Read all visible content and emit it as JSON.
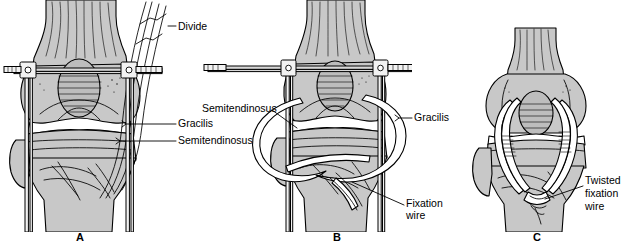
{
  "figure": {
    "background_color": "#ffffff",
    "bone_fill_color": "#c8c8c8",
    "bone_shade_color": "#a9a9a9",
    "line_color": "#000000",
    "graft_color": "#ffffff"
  },
  "panels": [
    {
      "id": "A",
      "letter": "A",
      "labels": [
        {
          "key": "divide",
          "text": "Divide"
        },
        {
          "key": "gracilis",
          "text": "Gracilis"
        },
        {
          "key": "semitendinosus",
          "text": "Semitendinosus"
        }
      ]
    },
    {
      "id": "B",
      "letter": "B",
      "labels": [
        {
          "key": "semitendinosus",
          "text": "Semitendinosus"
        },
        {
          "key": "gracilis",
          "text": "Gracilis"
        },
        {
          "key": "fixation_line1",
          "text": "Fixation"
        },
        {
          "key": "fixation_line2",
          "text": "wire"
        }
      ]
    },
    {
      "id": "C",
      "letter": "C",
      "labels": [
        {
          "key": "twisted_line1",
          "text": "Twisted"
        },
        {
          "key": "twisted_line2",
          "text": "fixation"
        },
        {
          "key": "twisted_line3",
          "text": "wire"
        }
      ]
    }
  ],
  "icons": {
    "leader_line": "leader-line",
    "graft_loop": "tendon-graft-loop",
    "fixator_pin": "external-fixator-pin"
  }
}
